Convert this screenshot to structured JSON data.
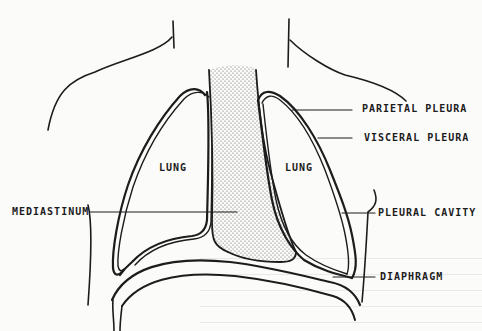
{
  "diagram": {
    "title": "",
    "labels": {
      "parietal_pleura": "PARIETAL PLEURA",
      "visceral_pleura": "VISCERAL PLEURA",
      "lung_left": "LUNG",
      "lung_right": "LUNG",
      "mediastinum": "MEDIASTINUM",
      "pleural_cavity": "PLEURAL CAVITY",
      "diaphragm": "DIAPHRAGM"
    },
    "colors": {
      "ink": "#1c1c1c",
      "paper": "#fbfbfa",
      "stipple": "#6d6d6d"
    }
  }
}
